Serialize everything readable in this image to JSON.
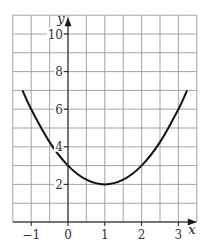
{
  "chart_data": {
    "type": "line",
    "title": "",
    "xlabel": "x",
    "ylabel": "y",
    "xlim": [
      -1.5,
      3.5
    ],
    "ylim": [
      0,
      11
    ],
    "grid": true,
    "grid_spacing": {
      "x": 0.5,
      "y": 1
    },
    "x_ticks": [
      -1,
      0,
      1,
      2,
      3
    ],
    "x_tick_labels": [
      "−1",
      "0",
      "1",
      "2",
      "3"
    ],
    "y_ticks": [
      2,
      4,
      6,
      8,
      10
    ],
    "y_tick_labels": [
      "2",
      "4",
      "6",
      "8",
      "10"
    ],
    "series": [
      {
        "name": "y = (x − 1)² + 2",
        "x": [
          -1.236,
          -1,
          -0.5,
          0,
          0.5,
          1,
          1.5,
          2,
          2.5,
          3,
          3.236
        ],
        "values": [
          7,
          6,
          4.25,
          3,
          2.25,
          2,
          2.25,
          3,
          4.25,
          6,
          7
        ]
      }
    ],
    "annotations": [],
    "legend": null
  },
  "colors": {
    "grid": "#9a9a9a",
    "axis": "#1a1a1a",
    "curve": "#111111",
    "background": "#ffffff"
  }
}
